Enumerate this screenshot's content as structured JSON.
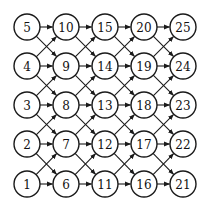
{
  "diagram": {
    "type": "directed-grid-graph",
    "colors": {
      "stroke": "#1a1a1a",
      "fill": "#ffffff",
      "text": "#111111"
    },
    "layout": {
      "columns_x": [
        27,
        66,
        105,
        144,
        183
      ],
      "rows_y": [
        27,
        66,
        105,
        144,
        184
      ],
      "node_radius": 13
    },
    "nodes": [
      {
        "id": 1,
        "label": "1",
        "col": 0,
        "row": 4
      },
      {
        "id": 2,
        "label": "2",
        "col": 0,
        "row": 3
      },
      {
        "id": 3,
        "label": "3",
        "col": 0,
        "row": 2
      },
      {
        "id": 4,
        "label": "4",
        "col": 0,
        "row": 1
      },
      {
        "id": 5,
        "label": "5",
        "col": 0,
        "row": 0
      },
      {
        "id": 6,
        "label": "6",
        "col": 1,
        "row": 4
      },
      {
        "id": 7,
        "label": "7",
        "col": 1,
        "row": 3
      },
      {
        "id": 8,
        "label": "8",
        "col": 1,
        "row": 2
      },
      {
        "id": 9,
        "label": "9",
        "col": 1,
        "row": 1
      },
      {
        "id": 10,
        "label": "10",
        "col": 1,
        "row": 0
      },
      {
        "id": 11,
        "label": "11",
        "col": 2,
        "row": 4
      },
      {
        "id": 12,
        "label": "12",
        "col": 2,
        "row": 3
      },
      {
        "id": 13,
        "label": "13",
        "col": 2,
        "row": 2
      },
      {
        "id": 14,
        "label": "14",
        "col": 2,
        "row": 1
      },
      {
        "id": 15,
        "label": "15",
        "col": 2,
        "row": 0
      },
      {
        "id": 16,
        "label": "16",
        "col": 3,
        "row": 4
      },
      {
        "id": 17,
        "label": "17",
        "col": 3,
        "row": 3
      },
      {
        "id": 18,
        "label": "18",
        "col": 3,
        "row": 2
      },
      {
        "id": 19,
        "label": "19",
        "col": 3,
        "row": 1
      },
      {
        "id": 20,
        "label": "20",
        "col": 3,
        "row": 0
      },
      {
        "id": 21,
        "label": "21",
        "col": 4,
        "row": 4
      },
      {
        "id": 22,
        "label": "22",
        "col": 4,
        "row": 3
      },
      {
        "id": 23,
        "label": "23",
        "col": 4,
        "row": 2
      },
      {
        "id": 24,
        "label": "24",
        "col": 4,
        "row": 1
      },
      {
        "id": 25,
        "label": "25",
        "col": 4,
        "row": 0
      }
    ],
    "edge_rule": "Each node in column c has directed edges to the node in the same row of column c+1 and to the nodes one row above and one row below in column c+1."
  }
}
